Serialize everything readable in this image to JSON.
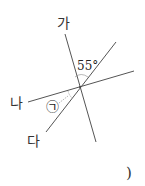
{
  "figure": {
    "lines": [
      {
        "name": "가",
        "label": "가"
      },
      {
        "name": "나",
        "label": "나"
      },
      {
        "name": "다",
        "label": "다"
      }
    ],
    "angle_given": "55°",
    "angle_unknown": "㉠",
    "answer_paren": ")"
  },
  "colors": {
    "line": "#444444",
    "text": "#333333"
  }
}
